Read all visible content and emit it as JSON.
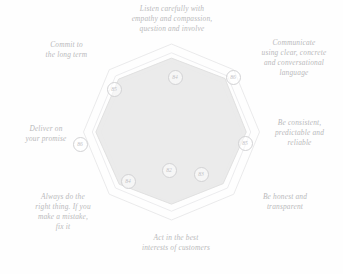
{
  "chart_data": {
    "type": "radar",
    "title": "",
    "subtitle": "",
    "xlabel": "",
    "ylabel": "",
    "rlim": [
      0,
      100
    ],
    "grid": true,
    "legend_position": "none",
    "rings": [
      100,
      90,
      80
    ],
    "categories": [
      "Listen carefully with empathy and compassion, question and involve",
      "Communicate using clear, concrete and conversational language",
      "Be consistent, predictable and reliable",
      "Be honest and transparent",
      "Act in the best interests of customers",
      "Always do the right thing. If you make a mistake, fix it",
      "Deliver on your promise",
      "Commit to the long term"
    ],
    "series": [
      {
        "name": "Score",
        "values": [
          84,
          86,
          85,
          83,
          82,
          84,
          86,
          85
        ]
      }
    ],
    "value_labels": [
      "84",
      "86",
      "85",
      "83",
      "82",
      "84",
      "86",
      "85"
    ],
    "colors": {
      "grid_stroke": "#e4e4e6",
      "series_fill": "#e9e9e9",
      "series_stroke": "#dcdcdc",
      "badge_text": "#c2c2c5",
      "label_text": "#b9b9bb",
      "background": "#fefefe"
    }
  },
  "axes": [
    {
      "id": "listen",
      "label": "Listen carefully with\nempathy and compassion,\nquestion and involve",
      "value": "84"
    },
    {
      "id": "communicate",
      "label": "Communicate\nusing clear, concrete\nand conversational\nlanguage",
      "value": "86"
    },
    {
      "id": "consistent",
      "label": "Be consistent,\npredictable and\nreliable",
      "value": "85"
    },
    {
      "id": "honest",
      "label": "Be honest and\ntransparent",
      "value": "83"
    },
    {
      "id": "customers",
      "label": "Act in the best\ninterests of customers",
      "value": "82"
    },
    {
      "id": "right-thing",
      "label": "Always do the\nright thing. If you\nmake a mistake,\nfix it",
      "value": "84"
    },
    {
      "id": "deliver",
      "label": "Deliver on\nyour promise",
      "value": "86"
    },
    {
      "id": "long-term",
      "label": "Commit to\nthe long term",
      "value": "85"
    }
  ]
}
